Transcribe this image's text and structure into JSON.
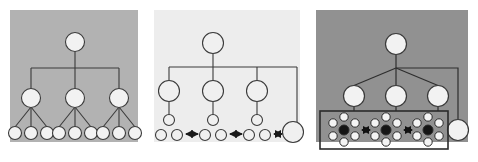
{
  "figure": {
    "width": 478,
    "height": 162,
    "background": "#ffffff"
  },
  "palette": {
    "panel_left_bg": "#b2b2b2",
    "panel_middle_bg": "#ededed",
    "panel_right_bg": "#919191",
    "panel_outer_bg": "#ffffff",
    "node_fill": "#f2f2f2",
    "node_fill_middle": "#f0f0f0",
    "node_stroke": "#3a3a3a",
    "node_dark_fill": "#151515",
    "edge_color": "#3a3a3a",
    "arrow_color": "#1a1a1a",
    "box_stroke": "#2b2b2b"
  },
  "panels": [
    {
      "id": "panel-left",
      "name": "coarse-hierarchy-panel",
      "x": 4,
      "y": 4,
      "width": 140,
      "height": 154,
      "inner_x": 10,
      "inner_y": 10,
      "inner_width": 128,
      "inner_height": 132,
      "background": "#b2b2b2",
      "node_radius_root": 9.5,
      "node_radius_mid": 9.5,
      "node_radius_leaf": 6.5,
      "root": {
        "cx": 75,
        "cy": 42,
        "r": 9.5
      },
      "mid_nodes": [
        {
          "cx": 31,
          "cy": 98,
          "r": 9.5
        },
        {
          "cx": 75,
          "cy": 98,
          "r": 9.5
        },
        {
          "cx": 119,
          "cy": 98,
          "r": 9.5
        }
      ],
      "leaf_nodes": [
        {
          "cx": 15,
          "cy": 133,
          "r": 6.5
        },
        {
          "cx": 31,
          "cy": 133,
          "r": 6.5
        },
        {
          "cx": 47,
          "cy": 133,
          "r": 6.5
        },
        {
          "cx": 59,
          "cy": 133,
          "r": 6.5
        },
        {
          "cx": 75,
          "cy": 133,
          "r": 6.5
        },
        {
          "cx": 91,
          "cy": 133,
          "r": 6.5
        },
        {
          "cx": 103,
          "cy": 133,
          "r": 6.5
        },
        {
          "cx": 119,
          "cy": 133,
          "r": 6.5
        },
        {
          "cx": 135,
          "cy": 133,
          "r": 6.5
        }
      ],
      "trunk": {
        "x": 75,
        "y1": 52,
        "y2": 68
      },
      "crossbar": {
        "x1": 31,
        "x2": 119,
        "y": 68
      },
      "counts": {
        "root": 1,
        "mid": 3,
        "leaf": 9
      }
    },
    {
      "id": "panel-middle",
      "name": "expanded-hierarchy-panel",
      "x": 148,
      "y": 4,
      "width": 158,
      "height": 154,
      "inner_x": 154,
      "inner_y": 10,
      "inner_width": 146,
      "inner_height": 132,
      "background": "#ededed",
      "root": {
        "cx": 213,
        "cy": 43,
        "r": 10.5
      },
      "bus": {
        "x1": 169,
        "x2": 297,
        "y": 67
      },
      "mid_nodes": [
        {
          "cx": 169,
          "cy": 91,
          "r": 10.5
        },
        {
          "cx": 213,
          "cy": 91,
          "r": 10.5
        },
        {
          "cx": 257,
          "cy": 91,
          "r": 10.5
        }
      ],
      "side_node": {
        "cx": 293,
        "cy": 132,
        "r": 10.5
      },
      "leaf_groups": [
        {
          "apex": {
            "cx": 169,
            "cy": 120,
            "r": 5.5
          },
          "children": [
            {
              "cx": 161,
              "cy": 135,
              "r": 5.5
            },
            {
              "cx": 177,
              "cy": 135,
              "r": 5.5
            }
          ]
        },
        {
          "apex": {
            "cx": 213,
            "cy": 120,
            "r": 5.5
          },
          "children": [
            {
              "cx": 205,
              "cy": 135,
              "r": 5.5
            },
            {
              "cx": 221,
              "cy": 135,
              "r": 5.5
            }
          ]
        },
        {
          "apex": {
            "cx": 257,
            "cy": 120,
            "r": 5.5
          },
          "children": [
            {
              "cx": 249,
              "cy": 135,
              "r": 5.5
            },
            {
              "cx": 265,
              "cy": 135,
              "r": 5.5
            }
          ]
        }
      ],
      "arrows": [
        {
          "x1": 186,
          "x2": 198,
          "y": 134,
          "type": "double"
        },
        {
          "x1": 230,
          "x2": 242,
          "y": 134,
          "type": "double"
        },
        {
          "x1": 274,
          "x2": 283,
          "y": 134,
          "type": "double"
        }
      ],
      "counts": {
        "root": 1,
        "mid": 3,
        "leaf_groups": 3,
        "leaves_per_group": 3,
        "side_nodes": 1,
        "arrows": 3
      }
    },
    {
      "id": "panel-right",
      "name": "detailed-cluster-panel",
      "x": 310,
      "y": 4,
      "width": 164,
      "height": 154,
      "inner_x": 316,
      "inner_y": 10,
      "inner_width": 152,
      "inner_height": 132,
      "background": "#919191",
      "root": {
        "cx": 396,
        "cy": 44,
        "r": 10.5
      },
      "mid_nodes": [
        {
          "cx": 354,
          "cy": 96,
          "r": 10.5
        },
        {
          "cx": 396,
          "cy": 96,
          "r": 10.5
        },
        {
          "cx": 438,
          "cy": 96,
          "r": 10.5
        }
      ],
      "side_node": {
        "cx": 458,
        "cy": 130,
        "r": 10.5
      },
      "side_path": {
        "from_x": 396,
        "corner_x": 458,
        "corner_y": 68,
        "to_y": 130
      },
      "cluster_box": {
        "x": 320,
        "y": 111,
        "width": 128,
        "height": 38
      },
      "clusters": [
        {
          "center": {
            "cx": 344,
            "cy": 130,
            "r": 5.0,
            "fill": "dark"
          },
          "satellites": [
            {
              "cx": 344,
              "cy": 117,
              "r": 4.2
            },
            {
              "cx": 355,
              "cy": 123,
              "r": 4.2
            },
            {
              "cx": 355,
              "cy": 136,
              "r": 4.2
            },
            {
              "cx": 344,
              "cy": 142,
              "r": 4.2
            },
            {
              "cx": 333,
              "cy": 136,
              "r": 4.2
            },
            {
              "cx": 333,
              "cy": 123,
              "r": 4.2
            }
          ]
        },
        {
          "center": {
            "cx": 386,
            "cy": 130,
            "r": 5.0,
            "fill": "dark"
          },
          "satellites": [
            {
              "cx": 386,
              "cy": 117,
              "r": 4.2
            },
            {
              "cx": 397,
              "cy": 123,
              "r": 4.2
            },
            {
              "cx": 397,
              "cy": 136,
              "r": 4.2
            },
            {
              "cx": 386,
              "cy": 142,
              "r": 4.2
            },
            {
              "cx": 375,
              "cy": 136,
              "r": 4.2
            },
            {
              "cx": 375,
              "cy": 123,
              "r": 4.2
            }
          ]
        },
        {
          "center": {
            "cx": 428,
            "cy": 130,
            "r": 5.0,
            "fill": "dark"
          },
          "satellites": [
            {
              "cx": 428,
              "cy": 117,
              "r": 4.2
            },
            {
              "cx": 439,
              "cy": 123,
              "r": 4.2
            },
            {
              "cx": 439,
              "cy": 136,
              "r": 4.2
            },
            {
              "cx": 428,
              "cy": 142,
              "r": 4.2
            },
            {
              "cx": 417,
              "cy": 136,
              "r": 4.2
            },
            {
              "cx": 417,
              "cy": 123,
              "r": 4.2
            }
          ]
        }
      ],
      "arrows": [
        {
          "x1": 362,
          "x2": 370,
          "y": 130,
          "type": "double"
        },
        {
          "x1": 404,
          "x2": 412,
          "y": 130,
          "type": "double"
        }
      ],
      "connector": {
        "x1": 448,
        "x2": 458,
        "y": 130
      },
      "counts": {
        "root": 1,
        "mid": 3,
        "clusters": 3,
        "nodes_per_cluster": 7,
        "side_nodes": 1,
        "arrows": 2
      }
    }
  ]
}
